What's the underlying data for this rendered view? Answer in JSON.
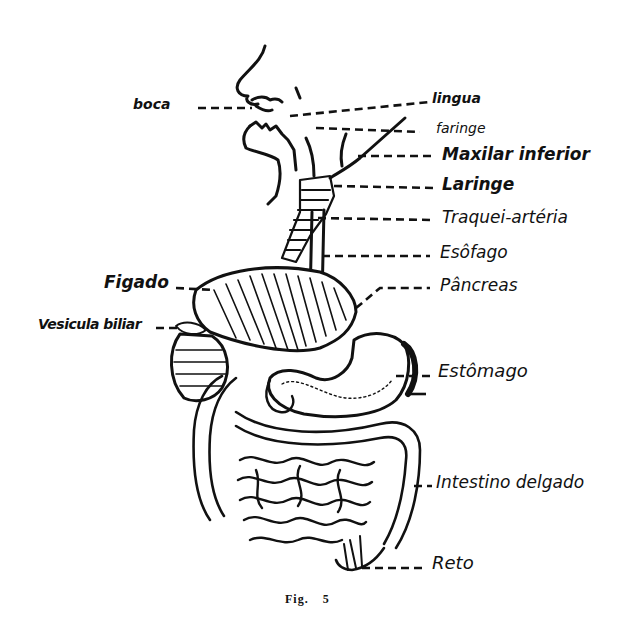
{
  "figure": {
    "caption_prefix": "Fig.",
    "caption_number": "5",
    "background": "#ffffff",
    "ink": "#111111"
  },
  "labels": {
    "boca": "boca",
    "lingua": "lingua",
    "faringe": "faringe",
    "maxilar_inferior": "Maxilar inferior",
    "laringe": "Laringe",
    "traqueia": "Traquei-artéria",
    "esofago": "Esôfago",
    "pancreas": "Pâncreas",
    "figado": "Figado",
    "vesicula": "Vesicula biliar",
    "estomago": "Estômago",
    "intestino": "Intestino delgado",
    "reto": "Reto"
  }
}
